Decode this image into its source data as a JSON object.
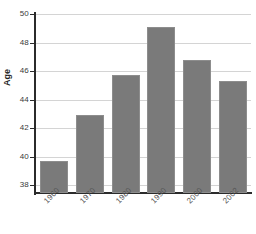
{
  "chart_data": {
    "type": "bar",
    "title": "",
    "subtitle": "",
    "xlabel": "",
    "ylabel": "Age",
    "categories": [
      "1960",
      "1970",
      "1980",
      "1990",
      "2000",
      "2002"
    ],
    "values": [
      39.7,
      42.9,
      45.75,
      49.1,
      46.8,
      45.3
    ],
    "series": [
      {
        "name": "Age",
        "values": [
          39.7,
          42.9,
          45.75,
          49.1,
          46.8,
          45.3
        ]
      }
    ],
    "ylim": [
      38,
      50
    ],
    "y_axis_base": 37.4,
    "yticks": [
      38,
      40,
      42,
      44,
      46,
      48,
      50
    ],
    "ytick_labels": [
      "38",
      "40",
      "42",
      "44",
      "46",
      "48",
      "50"
    ],
    "grid": true,
    "grid_axis": "y",
    "legend": false,
    "legend_position": "none",
    "bar_color": "#7a7a7a",
    "grid_color": "#d4d4d4",
    "axis_color": "#2b2b2b",
    "background_color": "#ffffff",
    "xtick_rotation": -45
  }
}
